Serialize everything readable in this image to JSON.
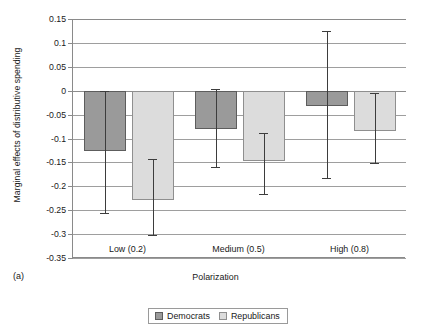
{
  "chart_data": {
    "type": "bar",
    "title": "",
    "panel_label": "(a)",
    "xlabel": "Polarization",
    "ylabel": "Marginal effects of distributive spending",
    "categories": [
      "Low (0.2)",
      "Medium (0.5)",
      "High (0.8)"
    ],
    "ylim": [
      -0.35,
      0.15
    ],
    "ytick_labels": [
      "0.15",
      "0.1",
      "0.05",
      "0",
      "-0.05",
      "-0.1",
      "-0.15",
      "-0.2",
      "-0.25",
      "-0.3",
      "-0.35"
    ],
    "ytick_values": [
      0.15,
      0.1,
      0.05,
      0,
      -0.05,
      -0.1,
      -0.15,
      -0.2,
      -0.25,
      -0.3,
      -0.35
    ],
    "grid": true,
    "legend_position": "bottom",
    "series": [
      {
        "name": "Democrats",
        "color": "#9a9a9a",
        "values": [
          -0.127,
          -0.08,
          -0.032
        ],
        "error_low": [
          -0.256,
          -0.159,
          -0.183
        ],
        "error_high": [
          0.0,
          0.003,
          0.125
        ]
      },
      {
        "name": "Republicans",
        "color": "#dcdcdc",
        "values": [
          -0.229,
          -0.148,
          -0.085
        ],
        "error_low": [
          -0.302,
          -0.216,
          -0.152
        ],
        "error_high": [
          -0.142,
          -0.089,
          -0.005
        ]
      }
    ]
  }
}
